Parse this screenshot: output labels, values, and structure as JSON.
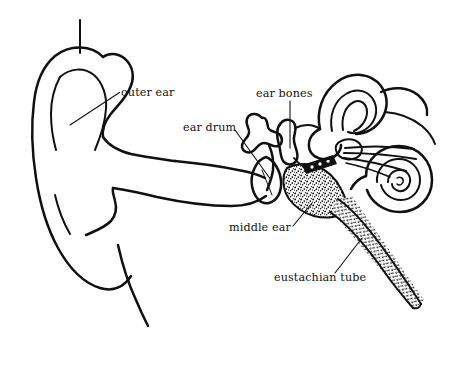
{
  "figure": {
    "background_color": "#ffffff",
    "ink_color": "#101010",
    "style": "black and white line drawing with stippled shading"
  },
  "labels": [
    {
      "id": "outer-ear",
      "text": "outer ear",
      "text_x": 121,
      "text_y": 96,
      "leader": "M 119.5 92.5 L 70 125"
    },
    {
      "id": "ear-drum",
      "text": "ear drum",
      "text_x": 183,
      "text_y": 131,
      "leader": "M 235 130 L 271 180"
    },
    {
      "id": "ear-bones",
      "text": "ear bones",
      "text_x": 256,
      "text_y": 97,
      "leader": "M 290 101 L 290 148"
    },
    {
      "id": "middle-ear",
      "text": "middle ear",
      "text_x": 229,
      "text_y": 231,
      "leader": "M 293 226 L 312 203"
    },
    {
      "id": "eustachian-tube",
      "text": "eustachian tube",
      "text_x": 274,
      "text_y": 281,
      "leader": "M 335 273 L 362 238"
    }
  ],
  "structures": [
    {
      "id": "pinna",
      "name": "outer ear (pinna)"
    },
    {
      "id": "ear-canal",
      "name": "ear canal"
    },
    {
      "id": "ear-drum-membrane",
      "name": "tympanic membrane"
    },
    {
      "id": "ossicles",
      "name": "ear bones (malleus, incus, stapes)"
    },
    {
      "id": "middle-ear-cavity",
      "name": "middle ear cavity (stippled)"
    },
    {
      "id": "semicircular-canals",
      "name": "semicircular canals"
    },
    {
      "id": "cochlea",
      "name": "cochlea"
    },
    {
      "id": "auditory-nerve",
      "name": "auditory nerve fibers"
    },
    {
      "id": "eustachian-tube-body",
      "name": "eustachian tube (stippled)"
    }
  ]
}
